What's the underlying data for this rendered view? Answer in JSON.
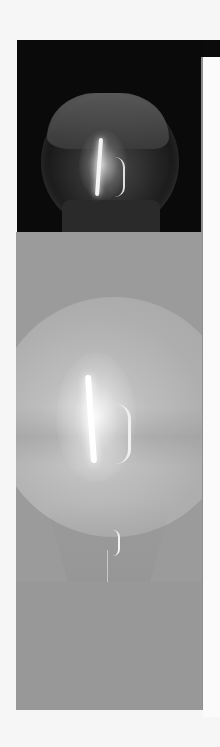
{
  "figure": {
    "panels": [
      {
        "name": "dark-inset",
        "background": "#0a0a0a",
        "tone": "dark"
      },
      {
        "name": "gray-main",
        "background": "#9b9b9b",
        "tone": "mid-gray"
      }
    ],
    "colors": {
      "page": "#f6f6f6",
      "dark_panel": "#0a0a0a",
      "gray_panel": "#9b9b9b",
      "filament": "#ffffff",
      "rule": "#8e8e8e"
    }
  }
}
